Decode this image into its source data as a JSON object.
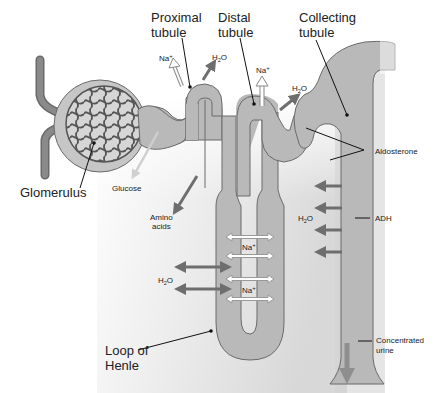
{
  "labels": {
    "proximal_tubule_1": "Proximal",
    "proximal_tubule_2": "tubule",
    "distal_tubule_1": "Distal",
    "distal_tubule_2": "tubule",
    "collecting_tubule_1": "Collecting",
    "collecting_tubule_2": "tubule",
    "glomerulus": "Glomerulus",
    "loop_of_henle_1": "Loop of",
    "loop_of_henle_2": "Henle",
    "glucose": "Glucose",
    "amino_acids_1": "Amino",
    "amino_acids_2": "acids",
    "aldosterone": "Aldosterone",
    "adh": "ADH",
    "concentrated_urine_1": "Concentrated",
    "concentrated_urine_2": "urine"
  },
  "ions": {
    "na_proximal": "Na",
    "na_distal": "Na",
    "na_loop_1": "Na",
    "na_loop_2": "Na",
    "plus": "+",
    "h2o_h": "H",
    "h2o_sub": "2",
    "h2o_o": "O"
  },
  "colors": {
    "tubule_fill": "#b9b9b9",
    "tubule_stroke": "#6a6a6a",
    "vessel": "#7a7a7a",
    "arrow_dark": "#6e6e6e",
    "background_panel": "#e4e4e4"
  }
}
